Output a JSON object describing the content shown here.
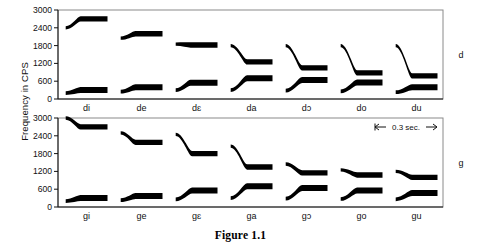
{
  "figure": {
    "caption": "Figure 1.1",
    "ylabel": "Frequency in CPS",
    "scale_label": "0.3 sec.",
    "panels": [
      {
        "id": "d",
        "label": "d",
        "consonant": "d"
      },
      {
        "id": "g",
        "label": "g",
        "consonant": "g"
      }
    ]
  },
  "axis": {
    "ticks": [
      "3000",
      "2400",
      "1800",
      "1200",
      "600",
      "0"
    ],
    "tick_values": [
      3000,
      2400,
      1800,
      1200,
      600,
      0
    ],
    "ymin": 0,
    "ymax": 3000,
    "units": "CPS"
  },
  "chart_data": {
    "type": "line",
    "title": "Figure 1.1",
    "subtitle": "Two-formant synthetic patterns for /d/ and /g/ before seven vowels",
    "xlabel": "",
    "ylabel": "Frequency in CPS",
    "ylim": [
      0,
      3000
    ],
    "yticks": [
      0,
      600,
      1200,
      1800,
      2400,
      3000
    ],
    "grid": false,
    "legend": "none",
    "scale_bar": {
      "label": "0.3 sec.",
      "duration_sec": 0.3
    },
    "panels": [
      {
        "name": "d",
        "label": "d",
        "categories": [
          "di",
          "de",
          "dɛ",
          "da",
          "dɔ",
          "do",
          "du"
        ],
        "syllables": [
          {
            "label": "di",
            "f1": {
              "onset": 200,
              "steady": 300,
              "transition_ms": 50
            },
            "f2": {
              "onset": 2400,
              "steady": 2700,
              "transition_ms": 50
            }
          },
          {
            "label": "de",
            "f1": {
              "onset": 250,
              "steady": 400,
              "transition_ms": 50
            },
            "f2": {
              "onset": 2050,
              "steady": 2200,
              "transition_ms": 50
            }
          },
          {
            "label": "dɛ",
            "f1": {
              "onset": 300,
              "steady": 550,
              "transition_ms": 50
            },
            "f2": {
              "onset": 1850,
              "steady": 1820,
              "transition_ms": 50
            }
          },
          {
            "label": "da",
            "f1": {
              "onset": 300,
              "steady": 700,
              "transition_ms": 55
            },
            "f2": {
              "onset": 1800,
              "steady": 1250,
              "transition_ms": 55
            }
          },
          {
            "label": "dɔ",
            "f1": {
              "onset": 280,
              "steady": 640,
              "transition_ms": 55
            },
            "f2": {
              "onset": 1800,
              "steady": 1050,
              "transition_ms": 55
            }
          },
          {
            "label": "do",
            "f1": {
              "onset": 260,
              "steady": 560,
              "transition_ms": 55
            },
            "f2": {
              "onset": 1800,
              "steady": 880,
              "transition_ms": 55
            }
          },
          {
            "label": "du",
            "f1": {
              "onset": 230,
              "steady": 400,
              "transition_ms": 55
            },
            "f2": {
              "onset": 1800,
              "steady": 780,
              "transition_ms": 55
            }
          }
        ]
      },
      {
        "name": "g",
        "label": "g",
        "categories": [
          "gi",
          "ge",
          "gɛ",
          "ga",
          "gɔ",
          "go",
          "gu"
        ],
        "syllables": [
          {
            "label": "gi",
            "f1": {
              "onset": 200,
              "steady": 300,
              "transition_ms": 50
            },
            "f2": {
              "onset": 3000,
              "steady": 2700,
              "transition_ms": 55
            }
          },
          {
            "label": "ge",
            "f1": {
              "onset": 230,
              "steady": 370,
              "transition_ms": 50
            },
            "f2": {
              "onset": 2500,
              "steady": 2180,
              "transition_ms": 55
            }
          },
          {
            "label": "gɛ",
            "f1": {
              "onset": 260,
              "steady": 560,
              "transition_ms": 55
            },
            "f2": {
              "onset": 2450,
              "steady": 1800,
              "transition_ms": 55
            }
          },
          {
            "label": "ga",
            "f1": {
              "onset": 300,
              "steady": 700,
              "transition_ms": 55
            },
            "f2": {
              "onset": 2050,
              "steady": 1350,
              "transition_ms": 55
            }
          },
          {
            "label": "gɔ",
            "f1": {
              "onset": 280,
              "steady": 640,
              "transition_ms": 55
            },
            "f2": {
              "onset": 1450,
              "steady": 1150,
              "transition_ms": 55
            }
          },
          {
            "label": "go",
            "f1": {
              "onset": 270,
              "steady": 560,
              "transition_ms": 55
            },
            "f2": {
              "onset": 1250,
              "steady": 1080,
              "transition_ms": 55
            }
          },
          {
            "label": "gu",
            "f1": {
              "onset": 260,
              "steady": 470,
              "transition_ms": 55
            },
            "f2": {
              "onset": 1200,
              "steady": 1000,
              "transition_ms": 55
            }
          }
        ]
      }
    ]
  },
  "colors": {
    "formant": "#000000",
    "frame": "#8a8a8a",
    "axis": "#111111",
    "background": "#ffffff"
  }
}
